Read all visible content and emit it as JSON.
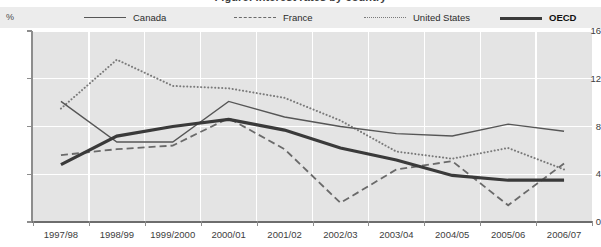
{
  "title": "Figure: Interest rates by country",
  "axis_unit_label": "%",
  "legend": [
    {
      "label": "Canada",
      "style": "solid-thin",
      "color": "#565656",
      "bold": false
    },
    {
      "label": "France",
      "style": "dashed",
      "color": "#6a6a6a",
      "bold": false
    },
    {
      "label": "United States",
      "style": "dotted",
      "color": "#7a7a7a",
      "bold": false
    },
    {
      "label": "OECD",
      "style": "solid-thick",
      "color": "#3a3a3a",
      "bold": true
    }
  ],
  "chart_data": {
    "type": "line",
    "title": "",
    "xlabel": "",
    "ylabel": "%",
    "ylim": [
      0,
      16
    ],
    "yticks": [
      0,
      4,
      8,
      12,
      16
    ],
    "grid": true,
    "legend_position": "top",
    "categories": [
      "1997/98",
      "1998/99",
      "1999/2000",
      "2000/01",
      "2001/02",
      "2002/03",
      "2003/04",
      "2004/05",
      "2005/06",
      "2006/07"
    ],
    "series": [
      {
        "name": "Canada",
        "style": "solid-thin",
        "color": "#565656",
        "values": [
          10.1,
          6.7,
          6.7,
          10.1,
          8.8,
          8.0,
          7.4,
          7.2,
          8.2,
          7.6
        ]
      },
      {
        "name": "France",
        "style": "dashed",
        "color": "#6a6a6a",
        "values": [
          5.6,
          6.1,
          6.4,
          8.7,
          6.1,
          1.6,
          4.4,
          5.1,
          1.4,
          4.9
        ]
      },
      {
        "name": "United States",
        "style": "dotted",
        "color": "#7a7a7a",
        "values": [
          9.5,
          13.6,
          11.4,
          11.2,
          10.4,
          8.5,
          5.9,
          5.3,
          6.2,
          4.4
        ]
      },
      {
        "name": "OECD",
        "style": "solid-thick",
        "color": "#3a3a3a",
        "values": [
          4.8,
          7.2,
          8.0,
          8.6,
          7.7,
          6.2,
          5.2,
          3.9,
          3.5,
          3.5
        ]
      }
    ]
  }
}
